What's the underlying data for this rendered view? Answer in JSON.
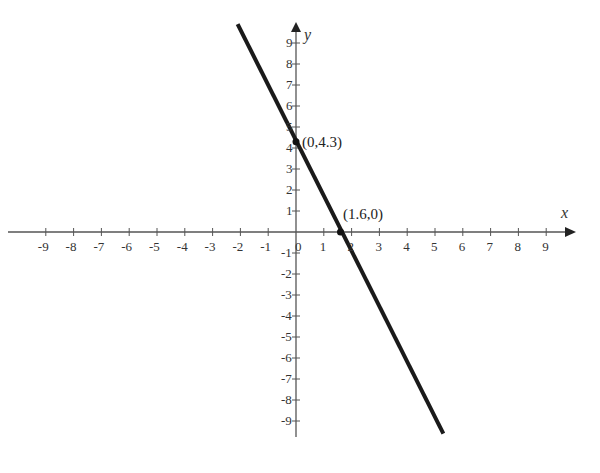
{
  "chart_data": {
    "type": "line",
    "title": "",
    "xlabel": "x",
    "ylabel": "y",
    "xlim": [
      -9.6,
      9.9
    ],
    "ylim": [
      -9.6,
      10
    ],
    "grid": false,
    "x_ticks": [
      -9,
      -8,
      -7,
      -6,
      -5,
      -4,
      -3,
      -2,
      -1,
      0,
      1,
      2,
      3,
      4,
      5,
      6,
      7,
      8,
      9
    ],
    "y_ticks": [
      9,
      8,
      7,
      6,
      5,
      4,
      3,
      2,
      1,
      -1,
      -2,
      -3,
      -4,
      -5,
      -6,
      -7,
      -8,
      -9
    ],
    "series": [
      {
        "name": "line",
        "x": [
          -2.1,
          5.3
        ],
        "y": [
          9.9,
          -9.6
        ],
        "slope": -2.69,
        "intercept": 4.3,
        "color": "#1a1a1a"
      }
    ],
    "annotations": [
      {
        "label": "(0,4.3)",
        "x": 0,
        "y": 4.3
      },
      {
        "label": "(1.6,0)",
        "x": 1.6,
        "y": 0
      }
    ]
  },
  "labels": {
    "x_axis": "x",
    "y_axis": "y",
    "y_intercept": "(0,4.3)",
    "x_intercept": "(1.6,0)",
    "origin": "0"
  }
}
